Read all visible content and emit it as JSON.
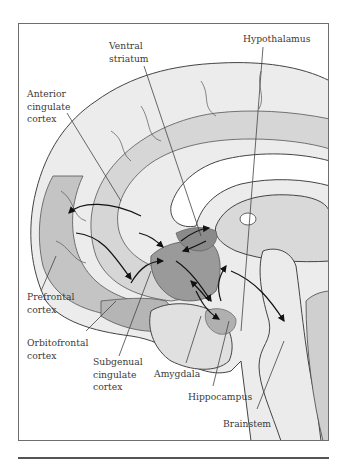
{
  "figure": {
    "type": "medial-sagittal brain diagram",
    "colors": {
      "cortex_light": "#ececec",
      "cortex_mid": "#d6d6d6",
      "highlight_region": "#b8b8b8",
      "dark_region": "#8f8f8f",
      "outline": "#444444",
      "arrow": "#111111",
      "frame": "#6e6e6e"
    },
    "labels": [
      {
        "id": "ventral-striatum",
        "text": "Ventral\nstriatum"
      },
      {
        "id": "hypothalamus",
        "text": "Hypothalamus"
      },
      {
        "id": "anterior-cingulate-cortex",
        "text": "Anterior\ncingulate\ncortex"
      },
      {
        "id": "prefrontal-cortex",
        "text": "Prefrontal\ncortex"
      },
      {
        "id": "orbitofrontal-cortex",
        "text": "Orbitofrontal\ncortex"
      },
      {
        "id": "subgenual-cingulate-cortex",
        "text": "Subgenual\ncingulate\ncortex"
      },
      {
        "id": "amygdala",
        "text": "Amygdala"
      },
      {
        "id": "hippocampus",
        "text": "Hippocampus"
      },
      {
        "id": "brainstem",
        "text": "Brainstem"
      }
    ]
  }
}
